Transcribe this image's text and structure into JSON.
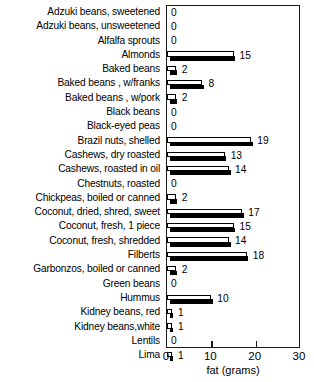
{
  "chart_data": {
    "type": "bar",
    "orientation": "horizontal",
    "title": "",
    "xlabel": "fat (grams)",
    "ylabel": "",
    "xlim": [
      0,
      30
    ],
    "xticks": [
      0,
      10,
      20,
      30
    ],
    "grid": false,
    "legend": null,
    "categories": [
      "Adzuki beans, sweetened",
      "Adzuki beans, unsweetened",
      "Alfalfa sprouts",
      "Almonds",
      "Baked beans",
      "Baked beans , w/franks",
      "Baked beans , w/pork",
      "Black beans",
      "Black-eyed peas",
      "Brazil nuts, shelled",
      "Cashews, dry roasted",
      "Cashews, roasted in oil",
      "Chestnuts, roasted",
      "Chickpeas, boiled or canned",
      "Coconut, dried, shred, sweet",
      "Coconut, fresh, 1 piece",
      "Coconut, fresh, shredded",
      "Filberts",
      "Garbonzos, boiled or canned",
      "Green beans",
      "Hummus",
      "Kidney beans, red",
      "Kidney beans,white",
      "Lentils",
      "Lima"
    ],
    "values": [
      0,
      0,
      0,
      15,
      2,
      8,
      2,
      0,
      0,
      19,
      13,
      14,
      0,
      2,
      17,
      15,
      14,
      18,
      2,
      0,
      10,
      1,
      1,
      0,
      1
    ],
    "value_labels": [
      "0",
      "0",
      "0",
      "15",
      "2",
      "8",
      "2",
      "0",
      "0",
      "19",
      "13",
      "14",
      "0",
      "2",
      "17",
      "15",
      "14",
      "18",
      "2",
      "0",
      "10",
      "1",
      "1",
      "0",
      "1"
    ]
  },
  "colors": {
    "bar_face": "#ffffff",
    "bar_outline": "#000000",
    "bar_shadow": "#000000",
    "axis": "#1a1a1a",
    "text": "#000000",
    "background": "#ffffff"
  }
}
